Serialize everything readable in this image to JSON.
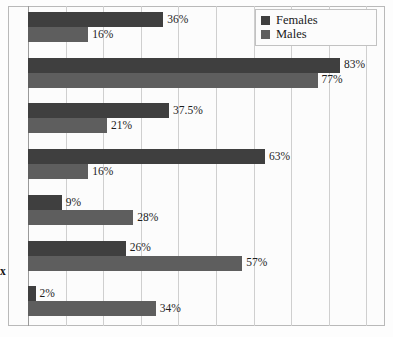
{
  "legend": {
    "position": "top-right",
    "items": [
      {
        "label": "Females",
        "color": "#3f3f3f"
      },
      {
        "label": "Males",
        "color": "#5e5e5e"
      }
    ]
  },
  "axis": {
    "clipped_category_label": "x",
    "tick_labels": [
      "0%",
      "10%",
      "20%",
      "30%",
      "40%",
      "50%",
      "60%",
      "70%",
      "80%",
      "90%"
    ]
  },
  "chart_data": {
    "type": "bar",
    "orientation": "horizontal",
    "title": "",
    "xlabel": "",
    "ylabel": "",
    "xlim": [
      0,
      90
    ],
    "grid": true,
    "grid_step": 10,
    "legend_position": "top-right",
    "categories": [
      "",
      "",
      "",
      "",
      "",
      "x",
      ""
    ],
    "series": [
      {
        "name": "Females",
        "color": "#3f3f3f",
        "values": [
          36,
          83,
          37.5,
          63,
          9,
          26,
          2
        ],
        "labels": [
          "36%",
          "83%",
          "37.5%",
          "63%",
          "9%",
          "26%",
          "2%"
        ]
      },
      {
        "name": "Males",
        "color": "#5e5e5e",
        "values": [
          16,
          77,
          21,
          16,
          28,
          57,
          34
        ],
        "labels": [
          "16%",
          "77%",
          "21%",
          "16%",
          "28%",
          "57%",
          "34%"
        ]
      }
    ]
  }
}
